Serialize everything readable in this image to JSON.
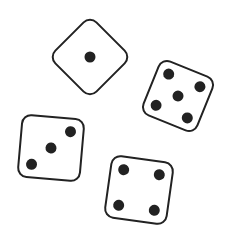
{
  "scene": {
    "description": "Four dice illustration",
    "colors": {
      "background": "#ffffff",
      "die_face": "#ffffff",
      "outline": "#222222",
      "pip": "#222222"
    },
    "dice": [
      {
        "name": "die-one",
        "value": 1
      },
      {
        "name": "die-five",
        "value": 5
      },
      {
        "name": "die-three",
        "value": 3
      },
      {
        "name": "die-four",
        "value": 4
      }
    ]
  }
}
